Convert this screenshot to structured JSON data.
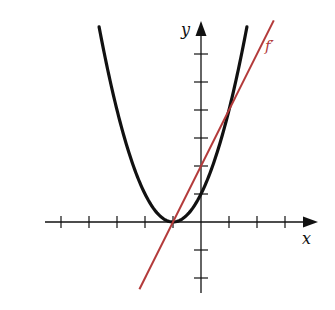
{
  "chart_data": {
    "type": "line",
    "title": "",
    "xlabel": "x",
    "ylabel": "y",
    "grid": false,
    "xlim": [
      -5.6,
      4.3
    ],
    "ylim": [
      -2.6,
      7.1
    ],
    "x_ticks": [
      -5,
      -4,
      -3,
      -2,
      -1,
      1,
      2,
      3
    ],
    "y_ticks": [
      -2,
      -1,
      1,
      2,
      3,
      4,
      5,
      6
    ],
    "series": [
      {
        "name": "f",
        "color": "#000000",
        "formula": "(x+1)^2",
        "x": [
          -3.64,
          -3,
          -2,
          -1,
          0,
          1,
          1.64
        ],
        "y": [
          6.97,
          4,
          1,
          0,
          1,
          4,
          6.97
        ]
      },
      {
        "name": "f'",
        "color": "#b33a3a",
        "formula": "2(x+1)",
        "x": [
          -2.2,
          -1,
          0,
          1,
          2.6
        ],
        "y": [
          -2.4,
          0,
          2,
          4,
          7.2
        ]
      }
    ],
    "annotations": [
      {
        "text": "f'",
        "near": "red line, upper right",
        "color": "#b33a3a"
      }
    ]
  },
  "labels": {
    "x_axis": "x",
    "y_axis": "y",
    "curve_label": "f′"
  },
  "colors": {
    "curve": "#111111",
    "derivative": "#b33a3a",
    "axis": "#111111"
  }
}
